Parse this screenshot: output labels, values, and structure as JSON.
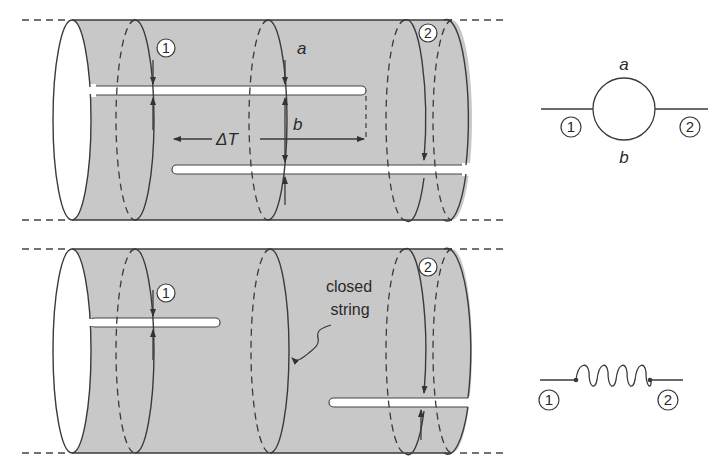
{
  "figure": {
    "top_panel": {
      "description": "one-loop open string diagram on a cylinder",
      "labels": {
        "state_1": "1",
        "state_2": "2",
        "boundary_a": "a",
        "boundary_b": "b",
        "time_interval": "ΔT"
      }
    },
    "top_feynman": {
      "description": "loop diagram",
      "labels": {
        "state_1": "1",
        "state_2": "2",
        "upper": "a",
        "lower": "b"
      }
    },
    "bottom_panel": {
      "description": "tree-level closed string exchange",
      "labels": {
        "state_1": "1",
        "state_2": "2",
        "closed_string_line1": "closed",
        "closed_string_line2": "string"
      }
    },
    "bottom_feynman": {
      "description": "closed string propagator",
      "labels": {
        "state_1": "1",
        "state_2": "2"
      }
    }
  },
  "colors": {
    "cylinder_fill": "#c8c8c8",
    "stroke": "#3a3a3a",
    "background": "#ffffff"
  }
}
